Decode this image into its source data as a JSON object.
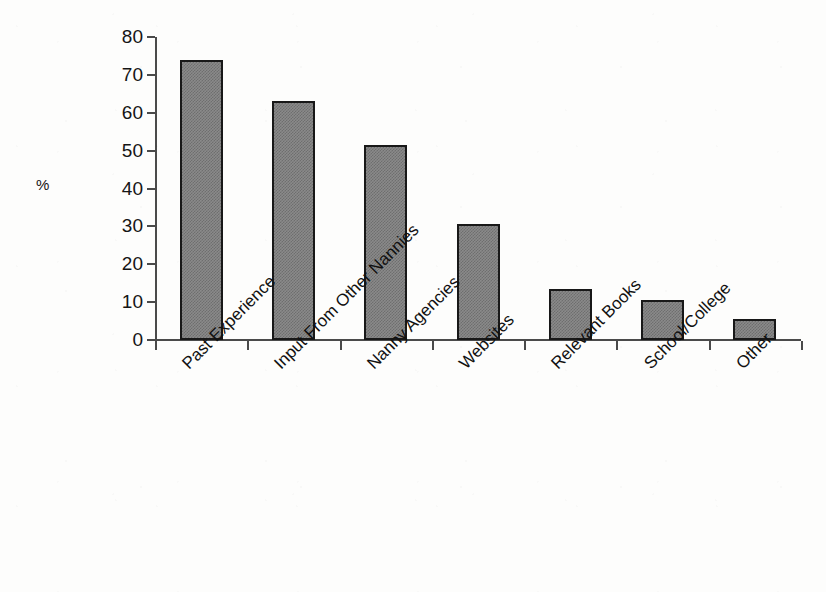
{
  "chart_data": {
    "type": "bar",
    "title": "",
    "xlabel": "",
    "ylabel": "%",
    "ylim": [
      0,
      80
    ],
    "ytick_step": 10,
    "yticks": [
      80,
      70,
      60,
      50,
      40,
      30,
      20,
      10,
      0
    ],
    "grid": false,
    "legend": null,
    "categories": [
      "Past Experience",
      "Input From Other Nannies",
      "Nanny Agencies",
      "Websites",
      "Relevant Books",
      "School/College",
      "Other"
    ],
    "values": [
      74,
      63,
      51.5,
      30.5,
      13.5,
      10.5,
      5.5
    ],
    "series": [
      {
        "name": "%",
        "values": [
          74,
          63,
          51.5,
          30.5,
          13.5,
          10.5,
          5.5
        ]
      }
    ],
    "bar_fill_color": "#8a8a8a",
    "bar_border_color": "#181818",
    "axis_color": "#4a4a4a",
    "background_color": "#ffffff",
    "category_label_rotation": -45
  }
}
